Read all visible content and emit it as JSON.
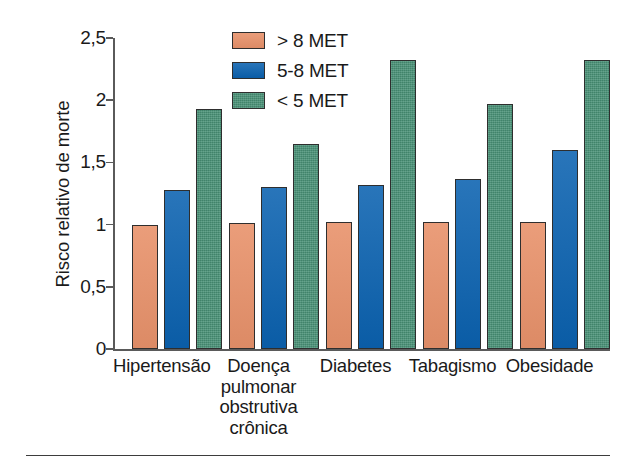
{
  "chart_data": {
    "type": "bar",
    "title": "",
    "xlabel": "",
    "ylabel": "Risco relativo de morte",
    "ylim": [
      0,
      2.5
    ],
    "ytick_labels": [
      "0",
      "0,5",
      "1",
      "1,5",
      "2",
      "2,5"
    ],
    "ytick_values": [
      0,
      0.5,
      1,
      1.5,
      2,
      2.5
    ],
    "grid": false,
    "legend_position": "top-center",
    "decimal_separator": ",",
    "categories": [
      "Hipertensão",
      "Doença pulmonar obstrutiva crônica",
      "Diabetes",
      "Tabagismo",
      "Obesidade"
    ],
    "category_lines": [
      [
        "Hipertensão"
      ],
      [
        "Doença",
        "pulmonar",
        "obstrutiva",
        "crônica"
      ],
      [
        "Diabetes"
      ],
      [
        "Tabagismo"
      ],
      [
        "Obesidade"
      ]
    ],
    "series": [
      {
        "name": "> 8 MET",
        "color": "#e8926b",
        "values": [
          1.0,
          1.01,
          1.02,
          1.02,
          1.02
        ]
      },
      {
        "name": "5-8 MET",
        "color": "#0b62b0",
        "values": [
          1.28,
          1.3,
          1.32,
          1.37,
          1.6
        ]
      },
      {
        "name": "< 5 MET",
        "color": "#479075",
        "values": [
          1.93,
          1.65,
          2.32,
          1.97,
          2.32
        ]
      }
    ]
  },
  "legend": {
    "items": [
      {
        "label": "> 8 MET",
        "color": "#e8926b"
      },
      {
        "label": "5-8 MET",
        "color": "#0b62b0"
      },
      {
        "label": "< 5 MET",
        "color": "#479075"
      }
    ]
  },
  "axis": {
    "y_title": "Risco relativo de morte",
    "y_ticks": [
      "2,5",
      "2",
      "1,5",
      "1",
      "0,5",
      "0"
    ]
  },
  "colors": {
    "series_1": "#e8926b",
    "series_2": "#0b62b0",
    "series_3": "#479075",
    "axis": "#5a5a5a",
    "text": "#1a1a1a",
    "background": "#ffffff"
  }
}
